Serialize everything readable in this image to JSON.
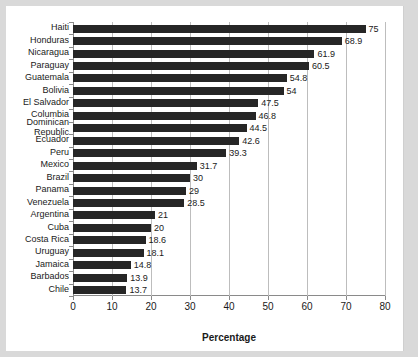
{
  "chart_data": {
    "type": "bar",
    "orientation": "horizontal",
    "title": "",
    "xlabel": "Percentage",
    "ylabel": "",
    "xlim": [
      0,
      80
    ],
    "xticks": [
      0,
      10,
      20,
      30,
      40,
      50,
      60,
      70,
      80
    ],
    "grid": "vertical",
    "legend": "none",
    "bar_color": "#262626",
    "categories": [
      "Haiti",
      "Honduras",
      "Nicaragua",
      "Paraguay",
      "Guatemala",
      "Bolivia",
      "El Salvador",
      "Columbia",
      "Dominican Republic",
      "Ecuador",
      "Peru",
      "Mexico",
      "Brazil",
      "Panama",
      "Venezuela",
      "Argentina",
      "Cuba",
      "Costa Rica",
      "Uruguay",
      "Jamaica",
      "Barbados",
      "Chile"
    ],
    "values": [
      75,
      68.9,
      61.9,
      60.5,
      54.8,
      54,
      47.5,
      46.8,
      44.5,
      42.6,
      39.3,
      31.7,
      30,
      29,
      28.5,
      21,
      20,
      18.6,
      18.1,
      14.8,
      13.9,
      13.7
    ],
    "value_labels": [
      "75",
      "68.9",
      "61.9",
      "60.5",
      "54.8",
      "54",
      "47.5",
      "46.8",
      "44.5",
      "42.6",
      "39.3",
      "31.7",
      "30",
      "29",
      "28.5",
      "21",
      "20",
      "18.6",
      "18.1",
      "14.8",
      "13.9",
      "13.7"
    ]
  }
}
